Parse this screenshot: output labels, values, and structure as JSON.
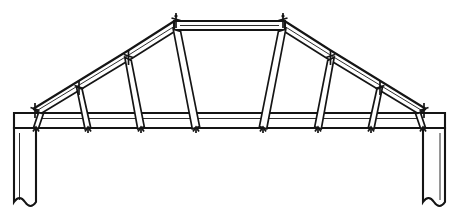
{
  "drawing": {
    "title": "Roof Truss Elevation",
    "type": "structural-elevation-line-drawing",
    "background_color": "#ffffff",
    "line_color": "#151515",
    "canvas": {
      "width": 459,
      "height": 216
    }
  },
  "structure": {
    "name": "bolted-roof-truss",
    "span_px": 390,
    "rise_px": 96,
    "description": "Symmetrical segmented bolted roof truss with horizontal tie beam, kinked rafters, flat collar tie at ridge and six inclined web posts per half, carried on two columns.",
    "members": {
      "bottom_chord": {
        "name": "tie-beam",
        "x1": 14,
        "x2": 445,
        "top_y": 113,
        "bottom_y": 128,
        "depth_px": 15,
        "style": "double-line-beam"
      },
      "collar_tie": {
        "name": "top-collar-tie",
        "x1": 175,
        "x2": 284,
        "top_y": 21,
        "bottom_y": 30,
        "depth_px": 9,
        "style": "double-line-beam"
      },
      "left_rafter": {
        "name": "left-upper-chord",
        "outer_polyline": [
          [
            33,
            109
          ],
          [
            129,
            50
          ],
          [
            176,
            20
          ]
        ],
        "inner_polyline": [
          [
            41,
            113
          ],
          [
            131,
            59
          ],
          [
            177,
            30
          ]
        ],
        "segments": 2
      },
      "right_rafter": {
        "name": "right-upper-chord",
        "outer_polyline": [
          [
            426,
            109
          ],
          [
            330,
            50
          ],
          [
            283,
            20
          ]
        ],
        "inner_polyline": [
          [
            418,
            113
          ],
          [
            328,
            59
          ],
          [
            282,
            30
          ]
        ],
        "segments": 2
      }
    },
    "web_posts": [
      {
        "id": "L1",
        "side": "left",
        "top": [
          41,
          113
        ],
        "bottom": [
          36,
          128
        ],
        "width_px": 4
      },
      {
        "id": "L2",
        "side": "left",
        "top": [
          79,
          88
        ],
        "bottom": [
          88,
          128
        ],
        "width_px": 5
      },
      {
        "id": "L3",
        "side": "left",
        "top": [
          128,
          59
        ],
        "bottom": [
          141,
          128
        ],
        "width_px": 6
      },
      {
        "id": "L4",
        "side": "left",
        "top": [
          177,
          31
        ],
        "bottom": [
          196,
          128
        ],
        "width_px": 7
      },
      {
        "id": "R4",
        "side": "right",
        "top": [
          282,
          31
        ],
        "bottom": [
          263,
          128
        ],
        "width_px": 7
      },
      {
        "id": "R3",
        "side": "right",
        "top": [
          331,
          59
        ],
        "bottom": [
          318,
          128
        ],
        "width_px": 6
      },
      {
        "id": "R2",
        "side": "right",
        "top": [
          380,
          88
        ],
        "bottom": [
          371,
          128
        ],
        "width_px": 5
      },
      {
        "id": "R1",
        "side": "right",
        "top": [
          418,
          113
        ],
        "bottom": [
          423,
          128
        ],
        "width_px": 4
      }
    ],
    "joints": [
      {
        "id": "J-heel-left",
        "x": 35,
        "y": 110,
        "kind": "heel-bolt"
      },
      {
        "id": "J-upper-L2",
        "x": 79,
        "y": 87,
        "kind": "rafter-bolt"
      },
      {
        "id": "J-upper-L3",
        "x": 128,
        "y": 56,
        "kind": "rafter-bolt"
      },
      {
        "id": "J-ridge-left",
        "x": 176,
        "y": 19,
        "kind": "ridge-bolt"
      },
      {
        "id": "J-ridge-right",
        "x": 283,
        "y": 19,
        "kind": "ridge-bolt"
      },
      {
        "id": "J-upper-R3",
        "x": 331,
        "y": 56,
        "kind": "rafter-bolt"
      },
      {
        "id": "J-upper-R2",
        "x": 380,
        "y": 87,
        "kind": "rafter-bolt"
      },
      {
        "id": "J-heel-right",
        "x": 424,
        "y": 110,
        "kind": "heel-bolt"
      },
      {
        "id": "J-chord-1",
        "x": 36,
        "y": 128,
        "kind": "chord-bolt"
      },
      {
        "id": "J-chord-2",
        "x": 88,
        "y": 128,
        "kind": "chord-bolt"
      },
      {
        "id": "J-chord-3",
        "x": 141,
        "y": 128,
        "kind": "chord-bolt"
      },
      {
        "id": "J-chord-4",
        "x": 196,
        "y": 128,
        "kind": "chord-bolt"
      },
      {
        "id": "J-chord-5",
        "x": 263,
        "y": 128,
        "kind": "chord-bolt"
      },
      {
        "id": "J-chord-6",
        "x": 318,
        "y": 128,
        "kind": "chord-bolt"
      },
      {
        "id": "J-chord-7",
        "x": 371,
        "y": 128,
        "kind": "chord-bolt"
      },
      {
        "id": "J-chord-8",
        "x": 423,
        "y": 128,
        "kind": "chord-bolt"
      }
    ],
    "columns": [
      {
        "id": "left-column",
        "name": "left-support-column",
        "x_left": 14,
        "x_right": 36,
        "top_y": 128,
        "bottom_y": 208,
        "base_symbol": "break-line"
      },
      {
        "id": "right-column",
        "name": "right-support-column",
        "x_left": 423,
        "x_right": 445,
        "top_y": 128,
        "bottom_y": 208,
        "base_symbol": "break-line"
      }
    ]
  }
}
